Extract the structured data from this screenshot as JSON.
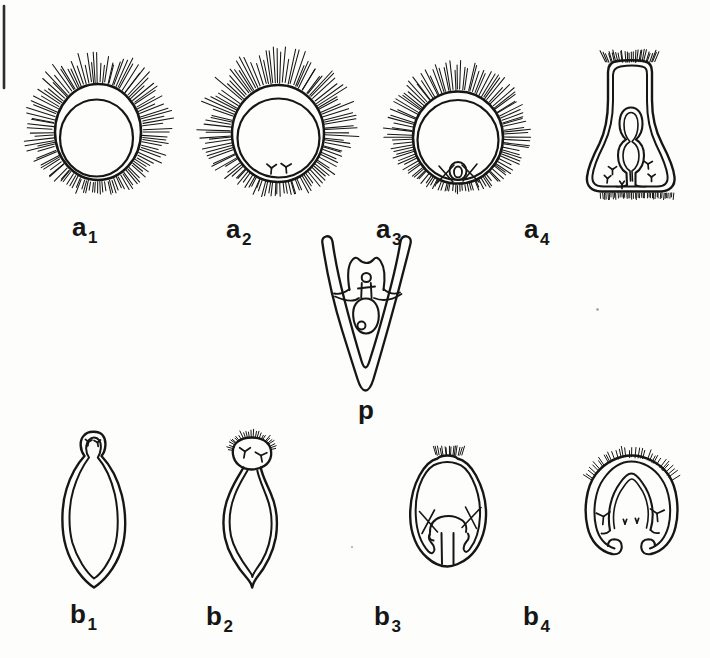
{
  "page": {
    "background": "#fdfdfc",
    "ink": "#161616"
  },
  "labels": {
    "a": [
      {
        "base": "a",
        "sub": "1"
      },
      {
        "base": "a",
        "sub": "2"
      },
      {
        "base": "a",
        "sub": "3"
      },
      {
        "base": "a",
        "sub": "4"
      }
    ],
    "p": {
      "base": "p",
      "sub": ""
    },
    "b": [
      {
        "base": "b",
        "sub": "1"
      },
      {
        "base": "b",
        "sub": "2"
      },
      {
        "base": "b",
        "sub": "3"
      },
      {
        "base": "b",
        "sub": "4"
      }
    ]
  },
  "drawings": {
    "a1": "ciliated-spherical-embryo",
    "a2": "ciliated-embryo-with-rudiment",
    "a3": "ciliated-embryo-with-gut-loop",
    "a4": "flask-shaped-ciliated-larva",
    "p": "pluteus-larva",
    "b1": "spindle-shaped-larva",
    "b2": "larva-with-ciliated-head",
    "b3": "rounded-larva-with-archenteron",
    "b4": "horseshoe-larva-with-archenteron"
  }
}
